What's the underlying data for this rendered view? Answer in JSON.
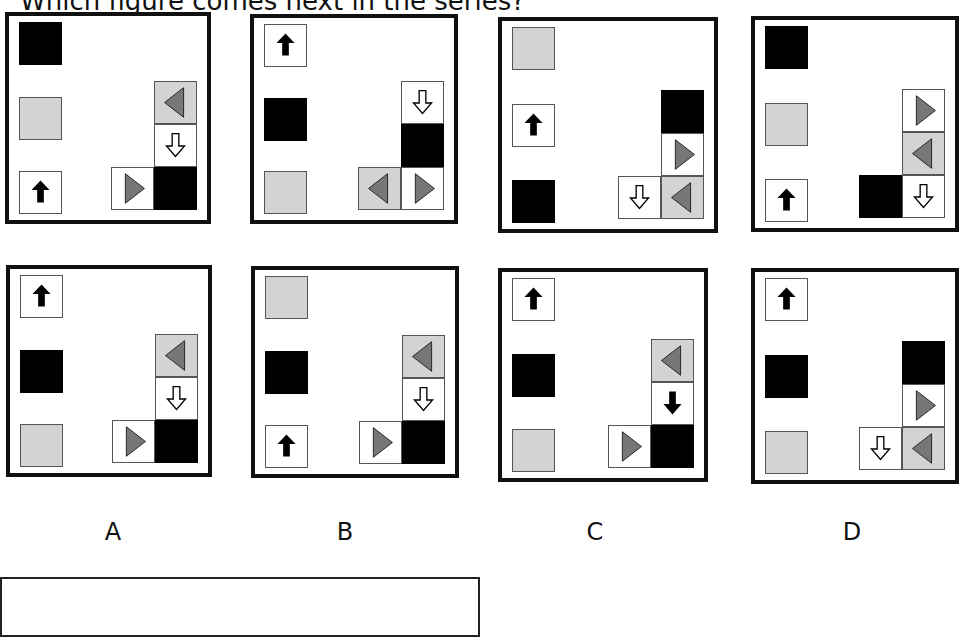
{
  "question": {
    "text": "Which figure comes next in the series?"
  },
  "colors": {
    "black": "#000000",
    "gray": "#d3d3d3",
    "triangle": "#777777",
    "border": "#111111"
  },
  "cell_legend": {
    "black": "solid black square",
    "gray": "solid light-gray square",
    "up-black-arrow": "white square with filled black up arrow",
    "down-hollow-arrow": "white square with hollow white down arrow",
    "down-black-arrow": "white square with filled black down arrow",
    "right-tri-white": "white square with dark-gray right-pointing triangle",
    "left-tri-gray": "light-gray square with dark-gray left-pointing triangle"
  },
  "series": [
    {
      "id": "series-1",
      "left_column": [
        "black",
        "gray",
        "up-black-arrow"
      ],
      "right_group": [
        {
          "pos": "r1c3",
          "cell": "left-tri-gray"
        },
        {
          "pos": "r2c3",
          "cell": "down-hollow-arrow"
        },
        {
          "pos": "r3c2",
          "cell": "right-tri-white"
        },
        {
          "pos": "r3c3",
          "cell": "black"
        }
      ]
    },
    {
      "id": "series-2",
      "left_column": [
        "up-black-arrow",
        "black",
        "gray"
      ],
      "right_group": [
        {
          "pos": "r1c3",
          "cell": "down-hollow-arrow"
        },
        {
          "pos": "r2c3",
          "cell": "black"
        },
        {
          "pos": "r3c2",
          "cell": "left-tri-gray"
        },
        {
          "pos": "r3c3",
          "cell": "right-tri-white"
        }
      ]
    },
    {
      "id": "series-3",
      "left_column": [
        "gray",
        "up-black-arrow",
        "black"
      ],
      "right_group": [
        {
          "pos": "r1c3",
          "cell": "black"
        },
        {
          "pos": "r2c3",
          "cell": "right-tri-white"
        },
        {
          "pos": "r3c2",
          "cell": "down-hollow-arrow"
        },
        {
          "pos": "r3c3",
          "cell": "left-tri-gray"
        }
      ]
    },
    {
      "id": "series-4",
      "left_column": [
        "black",
        "gray",
        "up-black-arrow"
      ],
      "right_group": [
        {
          "pos": "r1c3",
          "cell": "right-tri-white"
        },
        {
          "pos": "r2c3",
          "cell": "left-tri-gray"
        },
        {
          "pos": "r3c2",
          "cell": "black"
        },
        {
          "pos": "r3c3",
          "cell": "down-hollow-arrow"
        }
      ]
    }
  ],
  "options": [
    {
      "label": "A",
      "left_column": [
        "up-black-arrow",
        "black",
        "gray"
      ],
      "right_group": [
        {
          "pos": "r1c3",
          "cell": "left-tri-gray"
        },
        {
          "pos": "r2c3",
          "cell": "down-hollow-arrow"
        },
        {
          "pos": "r3c2",
          "cell": "right-tri-white"
        },
        {
          "pos": "r3c3",
          "cell": "black"
        }
      ]
    },
    {
      "label": "B",
      "left_column": [
        "gray",
        "black",
        "up-black-arrow"
      ],
      "right_group": [
        {
          "pos": "r1c3",
          "cell": "left-tri-gray"
        },
        {
          "pos": "r2c3",
          "cell": "down-hollow-arrow"
        },
        {
          "pos": "r3c2",
          "cell": "right-tri-white"
        },
        {
          "pos": "r3c3",
          "cell": "black"
        }
      ]
    },
    {
      "label": "C",
      "left_column": [
        "up-black-arrow",
        "black",
        "gray"
      ],
      "right_group": [
        {
          "pos": "r1c3",
          "cell": "left-tri-gray"
        },
        {
          "pos": "r2c3",
          "cell": "down-black-arrow"
        },
        {
          "pos": "r3c2",
          "cell": "right-tri-white"
        },
        {
          "pos": "r3c3",
          "cell": "black"
        }
      ]
    },
    {
      "label": "D",
      "left_column": [
        "up-black-arrow",
        "black",
        "gray"
      ],
      "right_group": [
        {
          "pos": "r1c3",
          "cell": "black"
        },
        {
          "pos": "r2c3",
          "cell": "right-tri-white"
        },
        {
          "pos": "r3c2",
          "cell": "down-hollow-arrow"
        },
        {
          "pos": "r3c3",
          "cell": "left-tri-gray"
        }
      ]
    }
  ],
  "answer_box": {
    "value": ""
  }
}
